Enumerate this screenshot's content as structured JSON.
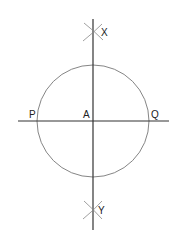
{
  "diagram": {
    "type": "geometric-construction",
    "colors": {
      "background": "#ffffff",
      "line": "#333333",
      "circle": "#777777",
      "arc_marks": "#888888",
      "label": "#222222"
    },
    "circle": {
      "cx": 93,
      "cy": 121,
      "r": 56
    },
    "vertical_line": {
      "x": 93,
      "y1": 19,
      "y2": 230
    },
    "horizontal_line": {
      "y": 121,
      "x1": 18,
      "x2": 169
    },
    "points": [
      {
        "id": "X",
        "label": "X",
        "x": 93,
        "y": 32,
        "lx": 101,
        "ly": 36
      },
      {
        "id": "Y",
        "label": "Y",
        "x": 93,
        "y": 210,
        "lx": 98,
        "ly": 214
      },
      {
        "id": "A",
        "label": "A",
        "x": 93,
        "y": 121,
        "lx": 83,
        "ly": 118
      },
      {
        "id": "P",
        "label": "P",
        "x": 37,
        "y": 121,
        "lx": 29,
        "ly": 118
      },
      {
        "id": "Q",
        "label": "Q",
        "x": 149,
        "y": 121,
        "lx": 151,
        "ly": 118
      }
    ]
  }
}
